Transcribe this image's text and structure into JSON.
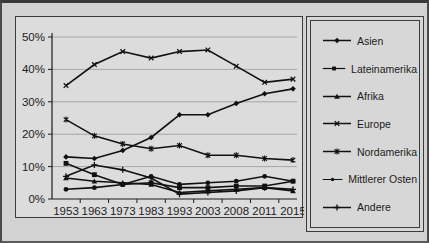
{
  "figure": {
    "background_color": "#d2d2d2",
    "frame_color": "#3a3a3a"
  },
  "chart_data": {
    "type": "line",
    "title": "",
    "xlabel": "",
    "ylabel": "",
    "categories": [
      "1953",
      "1963",
      "1973",
      "1983",
      "1993",
      "2003",
      "2008",
      "2011",
      "2015"
    ],
    "series": [
      {
        "name": "Asien",
        "marker": "diamond",
        "values": [
          13,
          12.5,
          15,
          19,
          26,
          26,
          29.5,
          32.5,
          34
        ]
      },
      {
        "name": "Lateinamerika",
        "marker": "square",
        "values": [
          11,
          7.5,
          4.5,
          5,
          3.5,
          3.5,
          4,
          4,
          5.5
        ]
      },
      {
        "name": "Afrika",
        "marker": "triangle",
        "values": [
          6.5,
          5.5,
          5,
          4.5,
          2,
          2.5,
          3,
          3.5,
          2.5
        ]
      },
      {
        "name": "Europe",
        "marker": "x",
        "values": [
          35,
          41.5,
          45.5,
          43.5,
          45.5,
          46,
          41,
          36,
          37
        ]
      },
      {
        "name": "Nordamerika",
        "marker": "asterisk",
        "values": [
          24.5,
          19.5,
          17,
          15.5,
          16.5,
          13.5,
          13.5,
          12.5,
          12
        ]
      },
      {
        "name": "Mittlerer Osten",
        "marker": "circle",
        "values": [
          3,
          3.5,
          4.5,
          7,
          4.5,
          5,
          5.5,
          7,
          5.5
        ]
      },
      {
        "name": "Andere",
        "marker": "plus",
        "values": [
          7,
          10.5,
          9,
          6.5,
          1.5,
          2,
          2.5,
          3.5,
          3
        ]
      }
    ],
    "ylim": [
      0,
      50
    ],
    "yticks_labels": [
      "0%",
      "10%",
      "20%",
      "30%",
      "40%",
      "50%"
    ],
    "grid": true,
    "legend_position": "right",
    "line_color": "#111111",
    "grid_color": "#a6a6a6",
    "axis_color": "#1c1c1c"
  }
}
